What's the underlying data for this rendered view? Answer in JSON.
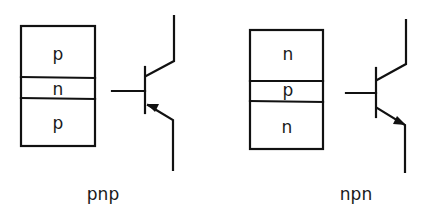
{
  "diagrams": [
    {
      "id": "pnp",
      "caption": "pnp",
      "layers": [
        "p",
        "n",
        "p"
      ],
      "symbol": "pnp-transistor"
    },
    {
      "id": "npn",
      "caption": "npn",
      "layers": [
        "n",
        "p",
        "n"
      ],
      "symbol": "npn-transistor"
    }
  ]
}
